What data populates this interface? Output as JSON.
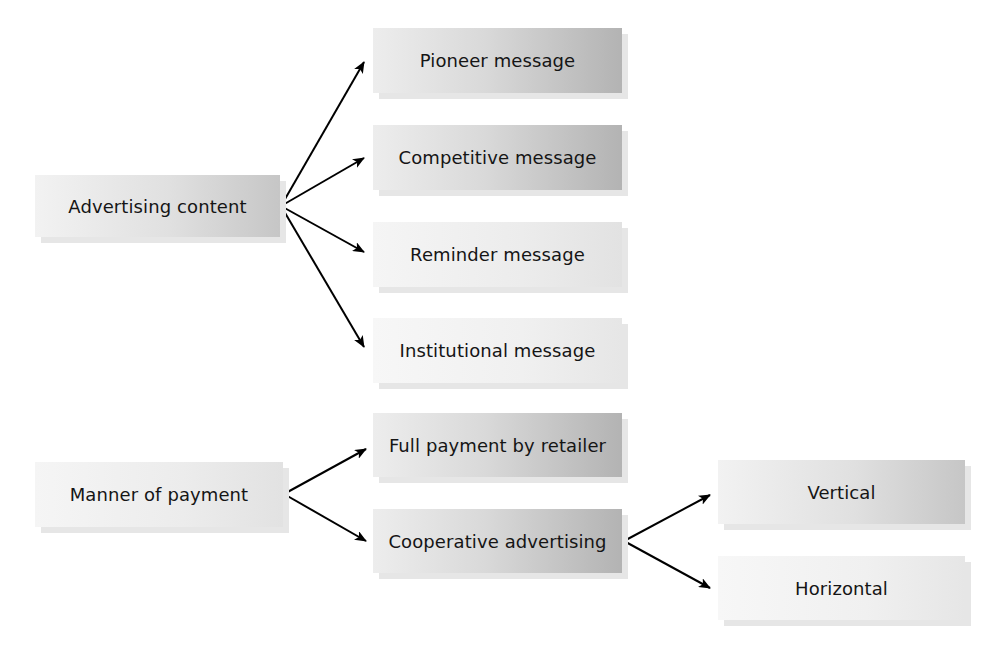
{
  "diagram": {
    "type": "tree",
    "roots": [
      {
        "label": "Advertising content",
        "children": [
          {
            "label": "Pioneer message"
          },
          {
            "label": "Competitive message"
          },
          {
            "label": "Reminder message"
          },
          {
            "label": "Institutional message"
          }
        ]
      },
      {
        "label": "Manner of payment",
        "children": [
          {
            "label": "Full payment by retailer"
          },
          {
            "label": "Cooperative advertising",
            "children": [
              {
                "label": "Vertical"
              },
              {
                "label": "Horizontal"
              }
            ]
          }
        ]
      }
    ]
  },
  "colors": {
    "box_light": "#f2f2f2",
    "box_dark": "#b3b3b3",
    "arrow": "#000000",
    "text": "#151515"
  }
}
